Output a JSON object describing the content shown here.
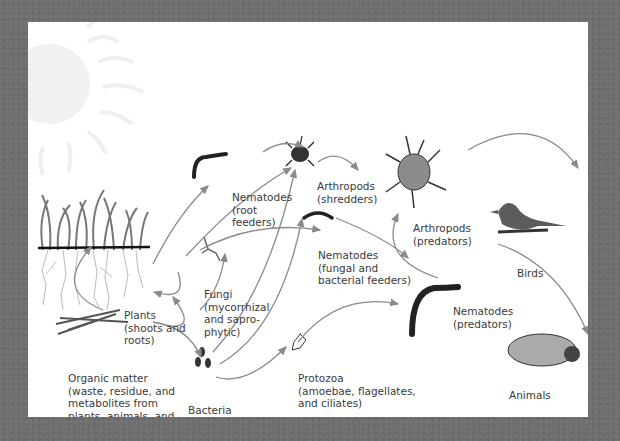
{
  "diagram": {
    "colors": {
      "background": "#6f6f6f",
      "panel": "#ffffff",
      "arrow": "#8a8a8a",
      "text": "#3a3a3a",
      "sun": "#efefef"
    },
    "nodes": [
      {
        "id": "plants",
        "lines": [
          "Plants",
          "(shoots and",
          "roots)"
        ]
      },
      {
        "id": "organic",
        "lines": [
          "Organic matter",
          "(waste, residue, and",
          "metabolites from",
          "plants, animals, and",
          "microbes)"
        ]
      },
      {
        "id": "nematodes_root",
        "lines": [
          "Nematodes",
          "(root",
          "feeders)"
        ]
      },
      {
        "id": "fungi",
        "lines": [
          "Fungi",
          "(mycorrhizal",
          "and sapro-",
          "phytic)"
        ]
      },
      {
        "id": "bacteria",
        "lines": [
          "Bacteria"
        ]
      },
      {
        "id": "arthropods_shredders",
        "lines": [
          "Arthropods",
          "(shredders)"
        ]
      },
      {
        "id": "nematodes_fungal",
        "lines": [
          "Nematodes",
          "(fungal and",
          "bacterial feeders)"
        ]
      },
      {
        "id": "protozoa",
        "lines": [
          "Protozoa",
          "(amoebae, flagellates,",
          "and ciliates)"
        ]
      },
      {
        "id": "arthropods_predators",
        "lines": [
          "Arthropods",
          "(predators)"
        ]
      },
      {
        "id": "nematodes_predators",
        "lines": [
          "Nematodes",
          "(predators)"
        ]
      },
      {
        "id": "birds",
        "lines": [
          "Birds"
        ]
      },
      {
        "id": "animals",
        "lines": [
          "Animals"
        ]
      }
    ]
  }
}
